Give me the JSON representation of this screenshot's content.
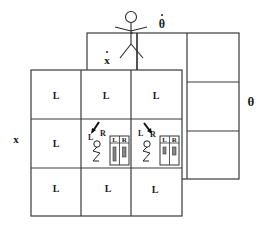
{
  "diagram": {
    "axis_labels": {
      "x": "x",
      "x_dot": "x",
      "theta": "θ",
      "theta_dot": "θ"
    },
    "front_grid": {
      "rows": [
        [
          "L",
          "L",
          "L"
        ],
        [
          "L",
          "",
          ""
        ],
        [
          "L",
          "L",
          "L"
        ]
      ]
    },
    "back_grid": {
      "rows": 3,
      "cols": 3
    },
    "agent_cells": [
      {
        "push_label_left": "L",
        "push_label_right": "R",
        "arrow": "down-left",
        "panel_left": "L",
        "panel_right": "R"
      },
      {
        "push_label_left": "L",
        "push_label_right": "R",
        "arrow": "down-right",
        "panel_left": "L",
        "panel_right": "R"
      }
    ]
  }
}
